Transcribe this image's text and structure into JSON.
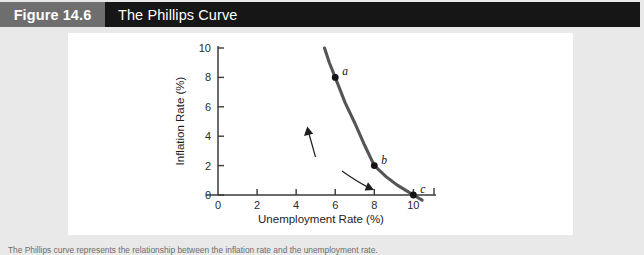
{
  "header": {
    "figure_number": "Figure 14.6",
    "figure_title": "The Phillips Curve",
    "number_box_color": "#6e6e6e",
    "bar_color": "#161616",
    "text_color": "#ffffff"
  },
  "page": {
    "background_color": "#e9e9e9",
    "panel_color": "#ffffff"
  },
  "caption": {
    "text": "The Phillips curve represents the relationship between the inflation rate and the unemployment rate."
  },
  "chart_data": {
    "type": "line",
    "title": "The Phillips Curve",
    "xlabel": "Unemployment Rate (%)",
    "ylabel": "Inflation Rate (%)",
    "xlim": [
      0,
      10.8
    ],
    "ylim": [
      0,
      10
    ],
    "xticks": [
      0,
      2,
      4,
      6,
      8,
      10
    ],
    "xtick_labels": [
      "0",
      "2",
      "4",
      "6",
      "8",
      "10"
    ],
    "yticks": [
      0,
      2,
      4,
      6,
      8,
      10
    ],
    "ytick_labels": [
      "0",
      "2",
      "4",
      "6",
      "8",
      "10"
    ],
    "grid": false,
    "legend": "none",
    "curve_color": "#555555",
    "series": [
      {
        "name": "Phillips curve",
        "x": [
          5.45,
          5.7,
          6.0,
          6.5,
          7.0,
          7.5,
          8.0,
          8.6,
          9.2,
          9.7,
          10.0,
          10.45
        ],
        "y": [
          10.0,
          9.0,
          8.0,
          6.3,
          4.9,
          3.4,
          2.0,
          1.25,
          0.65,
          0.25,
          0.0,
          -0.35
        ]
      }
    ],
    "points": [
      {
        "label": "a",
        "x": 6.0,
        "y": 8.0
      },
      {
        "label": "b",
        "x": 8.0,
        "y": 2.0
      },
      {
        "label": "c",
        "x": 10.0,
        "y": 0.0
      }
    ],
    "annotations": [
      {
        "name": "arrow-b-to-a",
        "direction": "up",
        "from": "b",
        "to": "a"
      },
      {
        "name": "arrow-b-to-c",
        "direction": "down-right",
        "from": "b",
        "to": "c"
      }
    ]
  }
}
